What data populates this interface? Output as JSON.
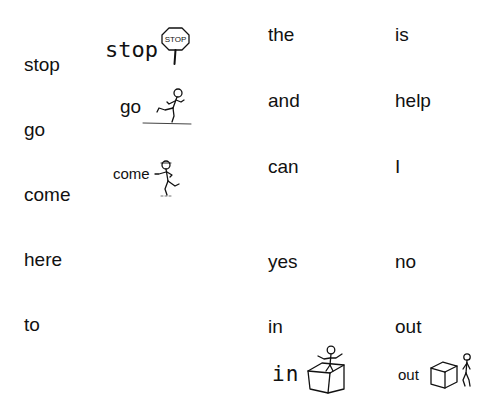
{
  "word_list": {
    "column_1": [
      "stop",
      "go",
      "come",
      "here",
      "to"
    ],
    "column_3": [
      "the",
      "and",
      "can",
      "yes",
      "in"
    ],
    "column_4": [
      "is",
      "help",
      "I",
      "no",
      "out"
    ]
  },
  "picture_cards": [
    {
      "label": "stop",
      "icon": "stop-sign-icon",
      "sign_text": "STOP"
    },
    {
      "label": "go",
      "icon": "running-person-icon"
    },
    {
      "label": "come",
      "icon": "walking-person-icon"
    },
    {
      "label": "in",
      "icon": "person-in-box-icon"
    },
    {
      "label": "out",
      "icon": "person-out-of-box-icon"
    }
  ],
  "colors": {
    "text": "#111111",
    "background": "#ffffff"
  }
}
